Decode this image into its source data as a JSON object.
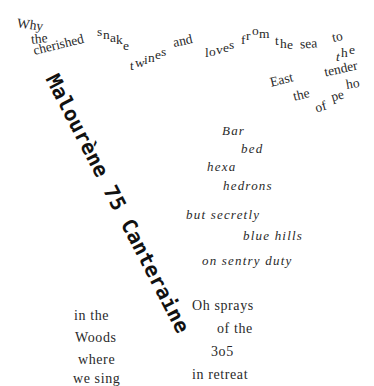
{
  "poem": {
    "top_wave": {
      "why": "Why",
      "the1": "the",
      "cherished": "cherished",
      "snake": [
        "s",
        "n",
        "a",
        "k",
        "e"
      ],
      "twines": [
        "t",
        "w",
        "i",
        "n",
        "e",
        "s"
      ],
      "and": "and",
      "loves": [
        "l",
        "o",
        "v",
        "e",
        "s"
      ],
      "from": [
        "f",
        "r",
        "o",
        "m"
      ],
      "the2": [
        "t",
        "h",
        "e"
      ],
      "sea": "sea",
      "to": "to",
      "the3": [
        "t",
        "h",
        "e"
      ],
      "tender": "tender",
      "east": "East",
      "the4": "the",
      "ho": "ho",
      "pe": "pe",
      "of": "of"
    },
    "diagonal": "Malourène 75 Canteraine",
    "center_italic": {
      "bar": "Bar",
      "bed": "bed",
      "hexa": "hexa",
      "hedrons": "hedrons",
      "but_secretly": "but secretly",
      "blue_hills": "blue hills",
      "on_sentry_duty": "on sentry duty"
    },
    "right_bottom": {
      "oh_sprays": "Oh sprays",
      "of_the": "of the",
      "num": "3o5",
      "in_retreat": "in retreat"
    },
    "left_bottom": {
      "in_the": "in the",
      "woods": "Woods",
      "where": "where",
      "we_sing": "we sing"
    }
  }
}
